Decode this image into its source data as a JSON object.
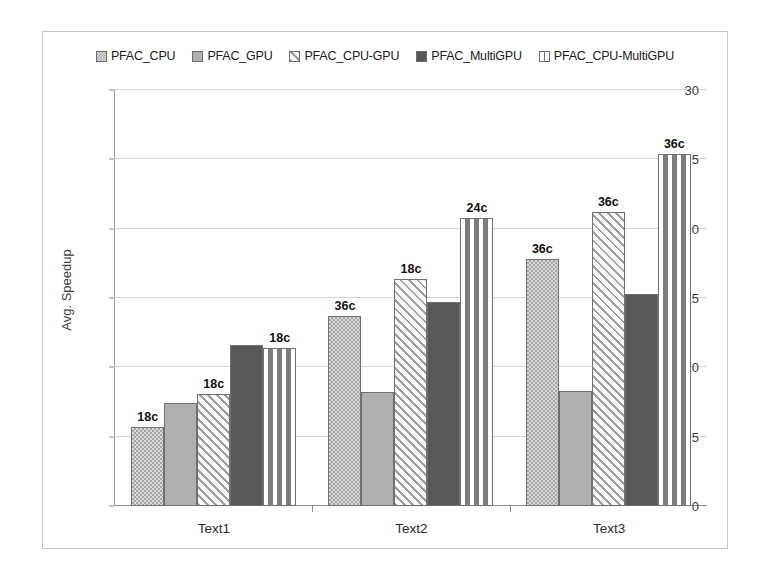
{
  "chart_data": {
    "type": "bar",
    "title": "",
    "xlabel": "",
    "ylabel": "Avg. Speedup",
    "ylim": [
      0,
      30
    ],
    "yticks": [
      0,
      5,
      10,
      15,
      20,
      25,
      30
    ],
    "grid": true,
    "legend_position": "top-center",
    "categories": [
      "Text1",
      "Text2",
      "Text3"
    ],
    "series": [
      {
        "name": "PFAC_CPU",
        "swatch": "light-checker-swatch",
        "values": [
          5.7,
          13.7,
          17.8
        ],
        "point_labels": [
          "18c",
          "36c",
          "36c"
        ]
      },
      {
        "name": "PFAC_GPU",
        "swatch": "solid-medium-grey-swatch",
        "values": [
          7.4,
          8.2,
          8.3
        ],
        "point_labels": [
          "",
          "",
          ""
        ]
      },
      {
        "name": "PFAC_CPU-GPU",
        "swatch": "diagonal-hatch-swatch",
        "values": [
          8.1,
          16.4,
          21.2
        ],
        "point_labels": [
          "18c",
          "18c",
          "36c"
        ]
      },
      {
        "name": "PFAC_MultiGPU",
        "swatch": "solid-dark-grey-swatch",
        "values": [
          11.6,
          14.7,
          15.3
        ],
        "point_labels": [
          "",
          "",
          ""
        ]
      },
      {
        "name": "PFAC_CPU-MultiGPU",
        "swatch": "dark-brick-swatch",
        "values": [
          11.4,
          20.8,
          25.4
        ],
        "point_labels": [
          "18c",
          "24c",
          "36c"
        ]
      }
    ],
    "colors": {
      "cpu": "#d9d9d9",
      "gpu": "#b0b0b0",
      "cpu_gpu": "#fbfbfb",
      "multigpu": "#585858",
      "cpu_multigpu": "#7d7d7d",
      "gridline": "#d4d4d4",
      "axis": "#8c8c8c",
      "frame": "#c8c8c8",
      "text": "#1a1a1a"
    }
  }
}
